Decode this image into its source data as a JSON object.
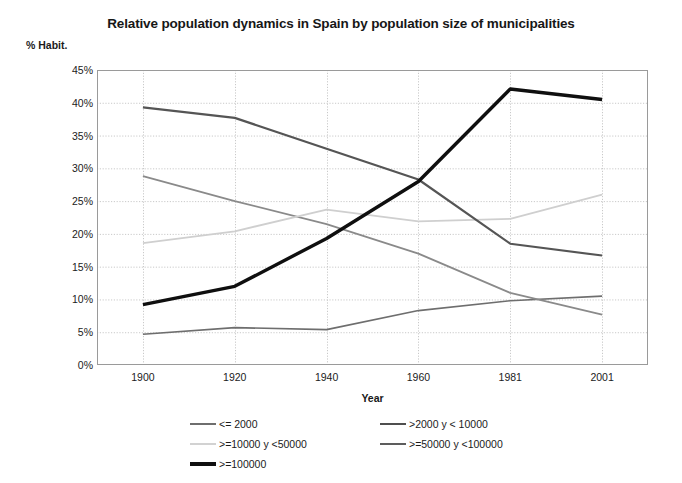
{
  "chart_data": {
    "type": "line",
    "title": "Relative population dynamics in Spain by population size of municipalities",
    "subtitle": "",
    "xlabel": "Year",
    "ylabel": "% Habit.",
    "categories": [
      "1900",
      "1920",
      "1940",
      "1960",
      "1981",
      "2001"
    ],
    "ylim": [
      0,
      45
    ],
    "ytick_labels": [
      "0%",
      "5%",
      "10%",
      "15%",
      "20%",
      "25%",
      "30%",
      "35%",
      "40%",
      "45%"
    ],
    "ytick_values": [
      0,
      5,
      10,
      15,
      20,
      25,
      30,
      35,
      40,
      45
    ],
    "grid": true,
    "legend_position": "bottom",
    "series": [
      {
        "name": "<= 2000",
        "color": "#6e6e6e",
        "width": 1.6,
        "values": [
          4.7,
          5.7,
          5.4,
          8.3,
          9.8,
          10.5
        ]
      },
      {
        "name": ">2000 y < 10000",
        "color": "#8a8a8a",
        "width": 1.8,
        "values": [
          28.8,
          25.0,
          21.5,
          17.0,
          11.0,
          7.7
        ]
      },
      {
        "name": ">=10000 y <50000",
        "color": "#cfcfcf",
        "width": 1.8,
        "values": [
          18.6,
          20.4,
          23.7,
          21.9,
          22.3,
          26.0
        ]
      },
      {
        "name": ">=50000 y <100000",
        "color": "#555555",
        "width": 2.2,
        "values": [
          39.3,
          37.7,
          33.0,
          28.3,
          18.5,
          16.7
        ]
      },
      {
        "name": ">=100000",
        "color": "#0f0f0f",
        "width": 3.4,
        "values": [
          9.2,
          12.0,
          19.3,
          28.0,
          42.1,
          40.5
        ]
      }
    ]
  },
  "legend": {
    "items": [
      {
        "label": "<= 2000",
        "color": "#6e6e6e",
        "thickness": 2
      },
      {
        "label": ">2000 y < 10000",
        "color": "#4f4f4f",
        "thickness": 2
      },
      {
        "label": ">=10000 y <50000",
        "color": "#d2d2d2",
        "thickness": 2
      },
      {
        "label": ">=50000 y <100000",
        "color": "#5d5d5d",
        "thickness": 2
      },
      {
        "label": ">=100000",
        "color": "#101010",
        "thickness": 3.5
      }
    ]
  },
  "style": {
    "plot_border": "#9a9a9a",
    "grid_color": "#c9c9c9",
    "background": "#ffffff"
  }
}
